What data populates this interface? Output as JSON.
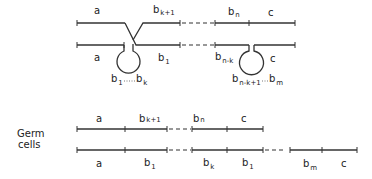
{
  "diagram": {
    "colors": {
      "stroke": "#333333",
      "text": "#222222",
      "background": "#ffffff"
    },
    "top": {
      "line1": {
        "a": "a",
        "bk1_base": "b",
        "bk1_sub": "k+1",
        "bn_base": "b",
        "bn_sub": "n",
        "c": "c"
      },
      "line2": {
        "a": "a",
        "b1_base": "b",
        "b1_sub": "1",
        "bnk_base": "b",
        "bnk_sub": "n-k",
        "c": "c"
      },
      "loop1": {
        "start_base": "b",
        "start_sub": "1",
        "end_base": "b",
        "end_sub": "k"
      },
      "loop2": {
        "start_base": "b",
        "start_sub": "n-k+1",
        "end_base": "b",
        "end_sub": "m"
      }
    },
    "germ": {
      "label_line1": "Germ",
      "label_line2": "cells",
      "line1": {
        "a": "a",
        "bk1_base": "b",
        "bk1_sub": "k+1",
        "bn_base": "b",
        "bn_sub": "n",
        "c": "c"
      },
      "line2": {
        "a": "a",
        "b1_base": "b",
        "b1_sub": "1",
        "bk_base": "b",
        "bk_sub": "k",
        "b1b_base": "b",
        "b1b_sub": "1",
        "bm_base": "b",
        "bm_sub": "m",
        "c": "c"
      }
    }
  }
}
